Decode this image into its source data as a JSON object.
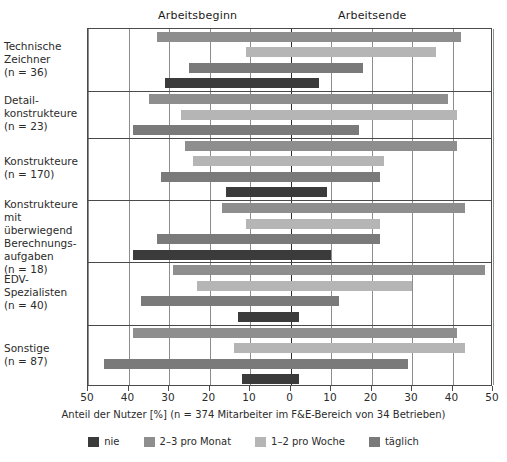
{
  "header": {
    "left_label": "Arbeitsbeginn",
    "right_label": "Arbeitsende"
  },
  "axis": {
    "caption": "Anteil der Nutzer [%] (n = 374 Mitarbeiter im F&E-Bereich von 34 Betrieben)",
    "tick_labels": [
      "50",
      "40",
      "30",
      "20",
      "10",
      "0",
      "10",
      "20",
      "30",
      "40",
      "50"
    ],
    "tick_values": [
      -50,
      -40,
      -30,
      -20,
      -10,
      0,
      10,
      20,
      30,
      40,
      50
    ],
    "range": [
      -50,
      50
    ]
  },
  "legend": {
    "items": [
      {
        "label": "nie",
        "color": "#3b3b3b",
        "key": "nie"
      },
      {
        "label": "2–3 pro Monat",
        "color": "#8e8e8e",
        "key": "monat"
      },
      {
        "label": "1–2 pro Woche",
        "color": "#b5b5b5",
        "key": "woche"
      },
      {
        "label": "täglich",
        "color": "#7a7a7a",
        "key": "taeglich"
      }
    ]
  },
  "categories": [
    {
      "lines": [
        "Technische",
        "Zeichner",
        "(n = 36)"
      ],
      "name": "Technische Zeichner",
      "n": 36
    },
    {
      "lines": [
        "Detail-",
        "konstrukteure",
        "(n = 23)"
      ],
      "name": "Detailkonstrukteure",
      "n": 23
    },
    {
      "lines": [
        "Konstrukteure",
        "(n = 170)"
      ],
      "name": "Konstrukteure",
      "n": 170
    },
    {
      "lines": [
        "Konstrukteure",
        "mit überwiegend",
        "Berechnungs-",
        "aufgaben",
        "(n = 18)"
      ],
      "name": "Konstrukteure mit überwiegend Berechnungsaufgaben",
      "n": 18
    },
    {
      "lines": [
        "EDV-",
        "Spezialisten",
        "(n = 40)"
      ],
      "name": "EDV-Spezialisten",
      "n": 40
    },
    {
      "lines": [
        "Sonstige",
        "(n = 87)"
      ],
      "name": "Sonstige",
      "n": 87
    }
  ],
  "chart_data": {
    "type": "bar",
    "orientation": "horizontal-diverging",
    "title": "",
    "xlabel": "Anteil der Nutzer [%] (n = 374 Mitarbeiter im F&E-Bereich von 34 Betrieben)",
    "ylabel": "",
    "xlim": [
      -50,
      50
    ],
    "xticks": [
      -50,
      -40,
      -30,
      -20,
      -10,
      0,
      10,
      20,
      30,
      40,
      50
    ],
    "xticklabels": [
      "50",
      "40",
      "30",
      "20",
      "10",
      "0",
      "10",
      "20",
      "30",
      "40",
      "50"
    ],
    "grid": true,
    "legend_position": "bottom",
    "note": "Left of 0 = Arbeitsbeginn (start of work), right of 0 = Arbeitsende (end of work). Values are percent share of users; 'start' is the negative (left) extent, 'end' is the positive (right) extent of each bar.",
    "categories": [
      "Technische Zeichner (n = 36)",
      "Detailkonstrukteure (n = 23)",
      "Konstrukteure (n = 170)",
      "Konstrukteure mit überwiegend Berechnungsaufgaben (n = 18)",
      "EDV-Spezialisten (n = 40)",
      "Sonstige (n = 87)"
    ],
    "series": [
      {
        "name": "2–3 pro Monat",
        "color": "#8e8e8e",
        "bars": [
          {
            "category": "Technische Zeichner (n = 36)",
            "start": -33,
            "end": 42
          },
          {
            "category": "Detailkonstrukteure (n = 23)",
            "start": -35,
            "end": 39
          },
          {
            "category": "Konstrukteure (n = 170)",
            "start": -26,
            "end": 41
          },
          {
            "category": "Konstrukteure mit überwiegend Berechnungsaufgaben (n = 18)",
            "start": -17,
            "end": 43
          },
          {
            "category": "EDV-Spezialisten (n = 40)",
            "start": -29,
            "end": 48
          },
          {
            "category": "Sonstige (n = 87)",
            "start": -39,
            "end": 41
          }
        ]
      },
      {
        "name": "1–2 pro Woche",
        "color": "#b5b5b5",
        "bars": [
          {
            "category": "Technische Zeichner (n = 36)",
            "start": -11,
            "end": 36
          },
          {
            "category": "Detailkonstrukteure (n = 23)",
            "start": -27,
            "end": 41
          },
          {
            "category": "Konstrukteure (n = 170)",
            "start": -24,
            "end": 23
          },
          {
            "category": "Konstrukteure mit überwiegend Berechnungsaufgaben (n = 18)",
            "start": -11,
            "end": 22
          },
          {
            "category": "EDV-Spezialisten (n = 40)",
            "start": -23,
            "end": 30
          },
          {
            "category": "Sonstige (n = 87)",
            "start": -14,
            "end": 43
          }
        ]
      },
      {
        "name": "täglich",
        "color": "#7a7a7a",
        "bars": [
          {
            "category": "Technische Zeichner (n = 36)",
            "start": -25,
            "end": 18
          },
          {
            "category": "Detailkonstrukteure (n = 23)",
            "start": -39,
            "end": 17
          },
          {
            "category": "Konstrukteure (n = 170)",
            "start": -32,
            "end": 22
          },
          {
            "category": "Konstrukteure mit überwiegend Berechnungsaufgaben (n = 18)",
            "start": -33,
            "end": 22
          },
          {
            "category": "EDV-Spezialisten (n = 40)",
            "start": -37,
            "end": 12
          },
          {
            "category": "Sonstige (n = 87)",
            "start": -46,
            "end": 29
          }
        ]
      },
      {
        "name": "nie",
        "color": "#3b3b3b",
        "bars": [
          {
            "category": "Technische Zeichner (n = 36)",
            "start": -31,
            "end": 7
          },
          {
            "category": "Detailkonstrukteure (n = 23)",
            "start": null,
            "end": null
          },
          {
            "category": "Konstrukteure (n = 170)",
            "start": -16,
            "end": 9
          },
          {
            "category": "Konstrukteure mit überwiegend Berechnungsaufgaben (n = 18)",
            "start": -39,
            "end": 10
          },
          {
            "category": "EDV-Spezialisten (n = 40)",
            "start": -13,
            "end": 2
          },
          {
            "category": "Sonstige (n = 87)",
            "start": -12,
            "end": 2
          }
        ]
      }
    ]
  },
  "rows": [
    {
      "group": "Technische Zeichner",
      "bars": [
        {
          "series": "2–3 pro Monat",
          "cls": "c-mon",
          "start": -33,
          "end": 42
        },
        {
          "series": "1–2 pro Woche",
          "cls": "c-woc",
          "start": -11,
          "end": 36
        },
        {
          "series": "täglich",
          "cls": "c-tag",
          "start": -25,
          "end": 18
        },
        {
          "series": "nie",
          "cls": "c-nie",
          "start": -31,
          "end": 7
        }
      ]
    },
    {
      "group": "Detailkonstrukteure",
      "bars": [
        {
          "series": "2–3 pro Monat",
          "cls": "c-mon",
          "start": -35,
          "end": 39
        },
        {
          "series": "1–2 pro Woche",
          "cls": "c-woc",
          "start": -27,
          "end": 41
        },
        {
          "series": "täglich",
          "cls": "c-tag",
          "start": -39,
          "end": 17
        }
      ]
    },
    {
      "group": "Konstrukteure",
      "bars": [
        {
          "series": "2–3 pro Monat",
          "cls": "c-mon",
          "start": -26,
          "end": 41
        },
        {
          "series": "1–2 pro Woche",
          "cls": "c-woc",
          "start": -24,
          "end": 23
        },
        {
          "series": "täglich",
          "cls": "c-tag",
          "start": -32,
          "end": 22
        },
        {
          "series": "nie",
          "cls": "c-nie",
          "start": -16,
          "end": 9
        }
      ]
    },
    {
      "group": "Konstrukteure mit überwiegend Berechnungsaufgaben",
      "bars": [
        {
          "series": "2–3 pro Monat",
          "cls": "c-mon",
          "start": -17,
          "end": 43
        },
        {
          "series": "1–2 pro Woche",
          "cls": "c-woc",
          "start": -11,
          "end": 22
        },
        {
          "series": "täglich",
          "cls": "c-tag",
          "start": -33,
          "end": 22
        },
        {
          "series": "nie",
          "cls": "c-nie",
          "start": -39,
          "end": 10
        }
      ]
    },
    {
      "group": "EDV-Spezialisten",
      "bars": [
        {
          "series": "2–3 pro Monat",
          "cls": "c-mon",
          "start": -29,
          "end": 48
        },
        {
          "series": "1–2 pro Woche",
          "cls": "c-woc",
          "start": -23,
          "end": 30
        },
        {
          "series": "täglich",
          "cls": "c-tag",
          "start": -37,
          "end": 12
        },
        {
          "series": "nie",
          "cls": "c-nie",
          "start": -13,
          "end": 2
        }
      ]
    },
    {
      "group": "Sonstige",
      "bars": [
        {
          "series": "2–3 pro Monat",
          "cls": "c-mon",
          "start": -39,
          "end": 41
        },
        {
          "series": "1–2 pro Woche",
          "cls": "c-woc",
          "start": -14,
          "end": 43
        },
        {
          "series": "täglich",
          "cls": "c-tag",
          "start": -46,
          "end": 29
        },
        {
          "series": "nie",
          "cls": "c-nie",
          "start": -12,
          "end": 2
        }
      ]
    }
  ]
}
